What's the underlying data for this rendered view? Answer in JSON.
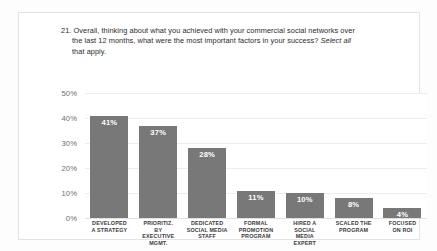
{
  "slide": {
    "background_color": "#fdfdfd",
    "card_background": "#ffffff",
    "card_border_color": "#e3e3e3"
  },
  "title": {
    "number": "21.",
    "line1": "21. Overall, thinking about what you achieved with your commercial social networks over",
    "line2": "the last 12 months, what were the most important factors in your success? ",
    "line2_italic": "Select all",
    "line3_italic": "that apply."
  },
  "chart_data": {
    "type": "bar",
    "title": "21. Overall, thinking about what you achieved with your commercial social networks over the last 12 months, what were the most important factors in your success? Select all that apply.",
    "xlabel": "",
    "ylabel": "",
    "ylim": [
      0,
      50
    ],
    "yticks": [
      "0%",
      "10%",
      "20%",
      "30%",
      "40%",
      "50%"
    ],
    "ytick_values": [
      0,
      10,
      20,
      30,
      40,
      50
    ],
    "grid": true,
    "legend": "none",
    "bar_color": "#787878",
    "value_label_color": "#ffffff",
    "categories": [
      "DEVELOPED A STRATEGY",
      "PRIORITIZ. BY EXECUTIVE MGMT.",
      "DEDICATED SOCIAL MEDIA STAFF",
      "FORMAL PROMOTION PROGRAM",
      "HIRED A SOCIAL MEDIA EXPERT",
      "SCALED THE PROGRAM",
      "FOCUSED ON ROI"
    ],
    "category_lines": [
      [
        "DEVELOPED",
        "A STRATEGY"
      ],
      [
        "PRIORITIZ.",
        "BY",
        "EXECUTIVE",
        "MGMT."
      ],
      [
        "DEDICATED",
        "SOCIAL MEDIA",
        "STAFF"
      ],
      [
        "FORMAL",
        "PROMOTION",
        "PROGRAM"
      ],
      [
        "HIRED A",
        "SOCIAL",
        "MEDIA",
        "EXPERT"
      ],
      [
        "SCALED THE",
        "PROGRAM"
      ],
      [
        "FOCUSED",
        "ON ROI"
      ]
    ],
    "values": [
      41,
      37,
      28,
      11,
      10,
      8,
      4
    ],
    "value_labels": [
      "41%",
      "37%",
      "28%",
      "11%",
      "10%",
      "8%",
      "4%"
    ]
  }
}
